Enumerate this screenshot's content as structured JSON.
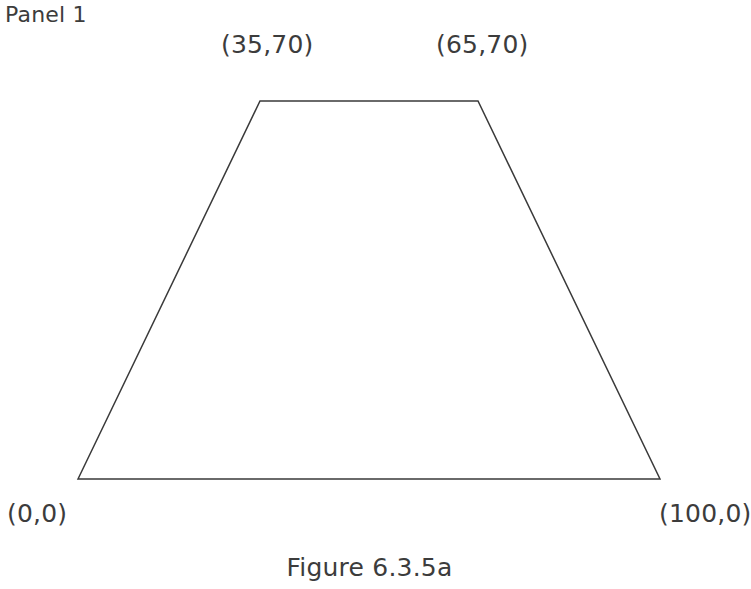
{
  "panel": {
    "label": "Panel 1"
  },
  "caption": {
    "text": "Figure 6.3.5a"
  },
  "annotations": {
    "top_left": "(35,70)",
    "top_right": "(65,70)",
    "bottom_left": "(0,0)",
    "bottom_right": "(100,0)"
  },
  "style": {
    "stroke_color": "#3a3a3a",
    "text_color": "#3c3c3c",
    "background": "#ffffff",
    "fill": "none",
    "stroke_width": 1.5
  },
  "chart_data": {
    "type": "scatter",
    "title": "Figure 6.3.5a",
    "subtitle": "Panel 1",
    "xlabel": "",
    "ylabel": "",
    "grid": false,
    "legend": null,
    "xlim": [
      0,
      100
    ],
    "ylim": [
      0,
      70
    ],
    "series": [
      {
        "name": "trapezoid",
        "shape": "closed-polygon",
        "fill": "none",
        "points": [
          {
            "x": 0,
            "y": 0,
            "label": "(0,0)",
            "pixel": [
              78,
              479
            ]
          },
          {
            "x": 35,
            "y": 70,
            "label": "(35,70)",
            "pixel": [
              260,
              101
            ]
          },
          {
            "x": 65,
            "y": 70,
            "label": "(65,70)",
            "pixel": [
              478,
              101
            ]
          },
          {
            "x": 100,
            "y": 0,
            "label": "(100,0)",
            "pixel": [
              660,
              479
            ]
          }
        ]
      }
    ],
    "annotations": [
      {
        "text": "Panel 1",
        "x": 5,
        "y": 2,
        "anchor": "top-left"
      },
      {
        "text": "(35,70)",
        "x": 221,
        "y": 30,
        "anchor": "above-vertex"
      },
      {
        "text": "(65,70)",
        "x": 436,
        "y": 30,
        "anchor": "above-vertex"
      },
      {
        "text": "(0,0)",
        "x": 7,
        "y": 499,
        "anchor": "below-vertex"
      },
      {
        "text": "(100,0)",
        "x": 659,
        "y": 499,
        "anchor": "below-vertex"
      },
      {
        "text": "Figure 6.3.5a",
        "x": 376,
        "y": 553,
        "anchor": "caption-center"
      }
    ]
  }
}
